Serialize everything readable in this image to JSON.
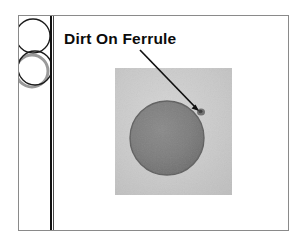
{
  "slide": {
    "title": "Dirt On Ferrule",
    "background_color": "#ffffff",
    "frame_border_color": "#8a8a8a",
    "divider_color": "#111111"
  },
  "decoration": {
    "circle_dark_color": "#1a1a1a",
    "circle_gray_color": "#9a9a9a",
    "circles": [
      {
        "name": "upper-dark-circle",
        "cx": 14,
        "cy": 20,
        "r": 17,
        "stroke": "#1a1a1a"
      },
      {
        "name": "lower-gray-circle",
        "cx": 13,
        "cy": 55,
        "r": 16,
        "stroke": "#9a9a9a"
      },
      {
        "name": "lower-dark-circle",
        "cx": 16,
        "cy": 52,
        "r": 17,
        "stroke": "#1a1a1a"
      }
    ]
  },
  "photo": {
    "name": "ferrule-photograph",
    "background_color": "#cbcbcb",
    "ferrule_color": "#7b7b7b",
    "ferrule_center_x": 52,
    "ferrule_center_y": 70,
    "ferrule_radius": 37,
    "dirt_spot": {
      "label": "dirt-speck",
      "x": 86,
      "y": 44,
      "color": "#4a4a4a"
    }
  },
  "annotation": {
    "arrow_label": "Dirt On Ferrule",
    "arrow_color": "#111111",
    "arrow_start_x": 140,
    "arrow_start_y": 50,
    "arrow_end_x": 199,
    "arrow_end_y": 111
  }
}
